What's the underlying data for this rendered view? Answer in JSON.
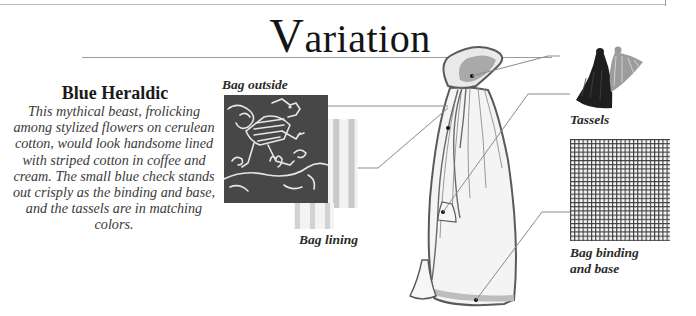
{
  "page": {
    "title_initial": "V",
    "title_rest": "ariation"
  },
  "intro": {
    "heading": "Blue Heraldic",
    "description": "This mythical beast, frolicking among stylized flowers on cerulean cotton, would look handsome lined with striped cotton in coffee and cream. The small blue check stands out crisply as the binding and base, and the tassels are in matching colors."
  },
  "labels": {
    "bag_outside": "Bag outside",
    "bag_lining": "Bag lining",
    "tassels": "Tassels",
    "bag_binding_line1": "Bag binding",
    "bag_binding_line2": "and base"
  },
  "illustrations": {
    "bag_outside_swatch": "heraldic-beast-fabric",
    "bag_lining_swatch": "striped-fabric",
    "tassels_photo": "two-tassels",
    "binding_swatch": "small-check-fabric",
    "bag_drawing": "drawstring-bag"
  },
  "colors": {
    "outside_fabric": "#4a4a4a",
    "stripe_dark": "#c4c4c4",
    "stripe_light": "#f1f1f1",
    "check_line": "#3a3a3a",
    "tassel_dark": "#1e1e1e",
    "tassel_light": "#8c8c8c",
    "leader_line": "#8a8a8a"
  }
}
